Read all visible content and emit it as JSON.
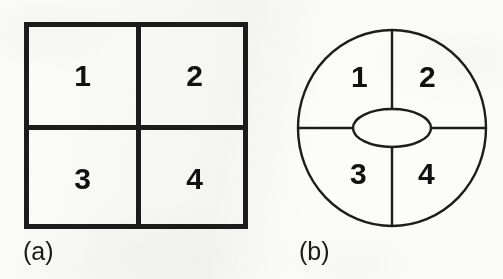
{
  "figure": {
    "background_color": "#fbfbfa",
    "ink_color": "#1c1c1c",
    "panels": [
      {
        "id": "square",
        "caption": "(a)",
        "shape": "square",
        "outline_stroke_px": 5,
        "description": "Square divided by a cross into four equal quadrants",
        "quadrants": [
          {
            "position": "top-left",
            "label": "1"
          },
          {
            "position": "top-right",
            "label": "2"
          },
          {
            "position": "bottom-left",
            "label": "3"
          },
          {
            "position": "bottom-right",
            "label": "4"
          }
        ]
      },
      {
        "id": "circle",
        "caption": "(b)",
        "shape": "circle",
        "outline_stroke_px": 2,
        "description": "Circle with a central ellipse, divided by a cross into four quadrants",
        "center_hole": {
          "shape": "ellipse",
          "label": ""
        },
        "quadrants": [
          {
            "position": "top-left",
            "label": "1"
          },
          {
            "position": "top-right",
            "label": "2"
          },
          {
            "position": "bottom-left",
            "label": "3"
          },
          {
            "position": "bottom-right",
            "label": "4"
          }
        ]
      }
    ]
  }
}
